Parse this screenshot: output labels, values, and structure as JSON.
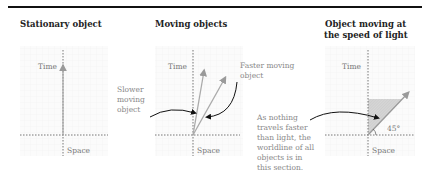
{
  "panels": [
    {
      "title": "Stationary object",
      "axis_x_label": "Space",
      "axis_y_label": "Time"
    },
    {
      "title": "Moving objects",
      "axis_x_label": "Space",
      "axis_y_label": "Time",
      "annotations": {
        "slower": [
          "Slower",
          "moving",
          "object"
        ],
        "faster": [
          "Faster moving",
          "object"
        ]
      }
    },
    {
      "title": [
        "Object moving at",
        "the speed of light"
      ],
      "axis_x_label": "Space",
      "axis_y_label": "Time",
      "angle_label": "45°",
      "annotation": [
        "As nothing",
        "travels faster",
        "than light, the",
        "worldline of all",
        "objects is in",
        "this section."
      ]
    }
  ],
  "colors": {
    "title": "#222222",
    "axis": "#555555",
    "arrow": "#aaaaaa",
    "shade": "#d9d9d9",
    "label": "#777777"
  }
}
